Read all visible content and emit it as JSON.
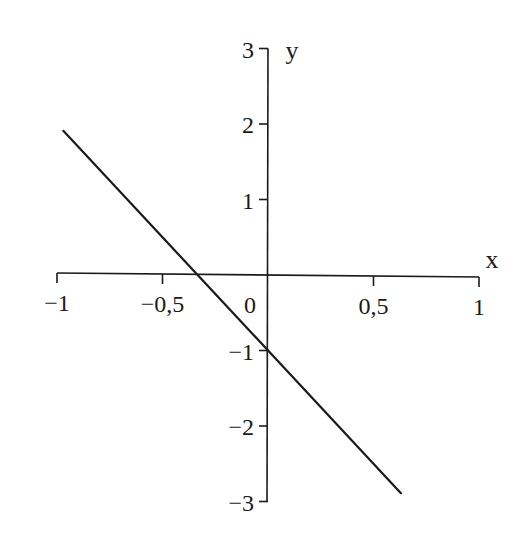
{
  "chart_data": {
    "type": "line",
    "title": "",
    "xlabel": "x",
    "ylabel": "y",
    "xlim": [
      -1,
      1
    ],
    "ylim": [
      -3,
      3
    ],
    "grid": false,
    "legend": null,
    "x_ticks": [
      -1,
      -0.5,
      0,
      0.5,
      1
    ],
    "x_tick_labels": [
      "−1",
      "−0,5",
      "0",
      "0,5",
      "1"
    ],
    "y_ticks": [
      -3,
      -2,
      -1,
      1,
      2,
      3
    ],
    "y_tick_labels": [
      "−3",
      "−2",
      "−1",
      "1",
      "2",
      "3"
    ],
    "series": [
      {
        "name": "y = -3x - 1",
        "x": [
          -0.97,
          0.63
        ],
        "y": [
          1.91,
          -2.89
        ],
        "color": "#1a1a1a"
      }
    ],
    "annotations": {
      "slope": -3,
      "y_intercept": -1,
      "x_intercept": -0.333
    }
  },
  "colors": {
    "axis": "#1a1a1a",
    "line": "#1a1a1a",
    "background": "#ffffff"
  }
}
